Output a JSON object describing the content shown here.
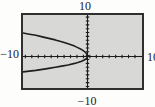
{
  "figure": {
    "type": "graphing-calculator-viewing-window",
    "labels": {
      "top": "10",
      "bottom": "−10",
      "left": "−10",
      "right": "10"
    }
  },
  "colors": {
    "page_bg": "#fdfdfc",
    "screen_bg": "#d8d8d6",
    "border": "#2f2f2f",
    "axis": "#1c1c1c",
    "curve": "#1e1e1e",
    "label": "#1a1a1a"
  },
  "chart_data": {
    "type": "line",
    "title": "",
    "xlabel": "",
    "ylabel": "",
    "xlim": [
      -10,
      10
    ],
    "ylim": [
      -10,
      10
    ],
    "xscl": 1,
    "yscl": 1,
    "grid": false,
    "legend": "none",
    "series": [
      {
        "name": "upper-branch",
        "points": [
          [
            -10,
            6.1
          ],
          [
            -9,
            5.8
          ],
          [
            -8,
            5.5
          ],
          [
            -7,
            5.1
          ],
          [
            -6,
            4.7
          ],
          [
            -5,
            4.3
          ],
          [
            -4,
            3.85
          ],
          [
            -3,
            3.3
          ],
          [
            -2,
            2.7
          ],
          [
            -1.5,
            2.3
          ],
          [
            -1,
            1.9
          ],
          [
            -0.5,
            1.35
          ],
          [
            -0.2,
            0.85
          ],
          [
            -0.05,
            0.4
          ],
          [
            0,
            0
          ]
        ]
      },
      {
        "name": "lower-branch",
        "points": [
          [
            -10,
            -4.0
          ],
          [
            -9,
            -3.8
          ],
          [
            -8,
            -3.6
          ],
          [
            -7,
            -3.35
          ],
          [
            -6,
            -3.1
          ],
          [
            -5,
            -2.8
          ],
          [
            -4,
            -2.5
          ],
          [
            -3,
            -2.2
          ],
          [
            -2,
            -1.8
          ],
          [
            -1.5,
            -1.55
          ],
          [
            -1,
            -1.3
          ],
          [
            -0.5,
            -0.9
          ],
          [
            -0.2,
            -0.55
          ],
          [
            -0.05,
            -0.3
          ],
          [
            0,
            0
          ]
        ]
      }
    ]
  }
}
